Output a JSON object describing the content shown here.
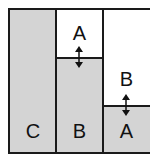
{
  "diagram": {
    "colors": {
      "shaded": "#d4d4d4",
      "empty": "#ffffff",
      "border": "#1a1a1a"
    },
    "columns": [
      {
        "id": "left",
        "blocks": [
          {
            "label": "C",
            "shaded": true
          }
        ]
      },
      {
        "id": "middle",
        "blocks": [
          {
            "label": "A",
            "shaded": false
          },
          {
            "label": "B",
            "shaded": true
          }
        ],
        "arrow": "double-vertical"
      },
      {
        "id": "right",
        "blocks": [
          {
            "label": "B",
            "shaded": false
          },
          {
            "label": "A",
            "shaded": true
          }
        ],
        "arrow": "double-vertical"
      }
    ],
    "labels": {
      "left_bottom": "C",
      "middle_top": "A",
      "middle_bottom": "B",
      "right_top": "B",
      "right_bottom": "A"
    }
  }
}
